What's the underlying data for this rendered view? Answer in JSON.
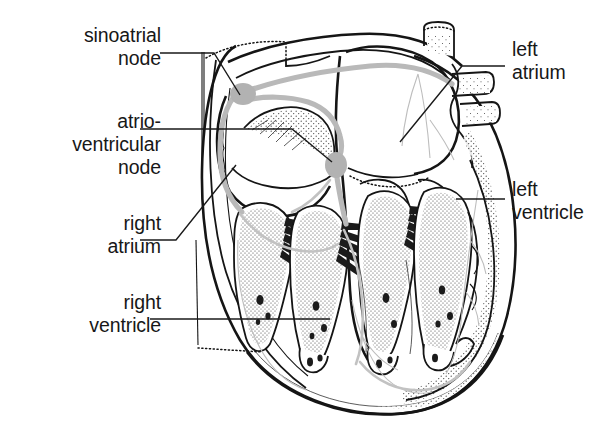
{
  "figure": {
    "type": "anatomical-diagram",
    "background_color": "#ffffff",
    "ink_color": "#151515",
    "conduction_color": "#b9b9b9"
  },
  "labels": [
    {
      "id": "sinoatrial-node",
      "text": "sinoatrial\nnode",
      "align": "right",
      "x": 46,
      "y": 24,
      "width": 115,
      "leader": "M160,53 L214,53 L240,95"
    },
    {
      "id": "atrioventricular-node",
      "text": "atrio-\nventricular\nnode",
      "align": "right",
      "x": 28,
      "y": 110,
      "width": 133,
      "leader": "M140,129 L292,129 L332,162"
    },
    {
      "id": "right-atrium",
      "text": "right\natrium",
      "align": "right",
      "x": 58,
      "y": 212,
      "width": 103,
      "leader": "M140,240 L176,240 L236,165"
    },
    {
      "id": "right-ventricle",
      "text": "right\nventricle",
      "align": "right",
      "x": 38,
      "y": 291,
      "width": 123,
      "leader": "M150,319 L330,319"
    },
    {
      "id": "left-atrium",
      "text": "left\natrium",
      "align": "left",
      "x": 512,
      "y": 38,
      "width": 100,
      "leader": "M505,66 L462,66 L400,142"
    },
    {
      "id": "left-ventricle",
      "text": "left\nventricle",
      "align": "left",
      "x": 512,
      "y": 178,
      "width": 103,
      "leader": "M505,199 L456,199"
    }
  ],
  "structures": [
    {
      "id": "sa-node-marker",
      "name": "sinoatrial node",
      "cx": 243,
      "cy": 94
    },
    {
      "id": "av-node-marker",
      "name": "atrioventricular node",
      "cx": 336,
      "cy": 165
    },
    {
      "id": "right-atrium-chamber",
      "name": "right atrium"
    },
    {
      "id": "left-atrium-chamber",
      "name": "left atrium"
    },
    {
      "id": "right-ventricle-chamber",
      "name": "right ventricle"
    },
    {
      "id": "left-ventricle-chamber",
      "name": "left ventricle"
    },
    {
      "id": "aorta",
      "name": "aorta"
    },
    {
      "id": "pulmonary-vein-upper",
      "name": "pulmonary vein"
    },
    {
      "id": "pulmonary-vein-lower",
      "name": "pulmonary vein"
    },
    {
      "id": "interventricular-septum",
      "name": "interventricular septum"
    },
    {
      "id": "papillary-muscles",
      "name": "papillary muscles and trabeculae"
    },
    {
      "id": "bundle-of-his",
      "name": "bundle of His / conduction pathway"
    }
  ]
}
